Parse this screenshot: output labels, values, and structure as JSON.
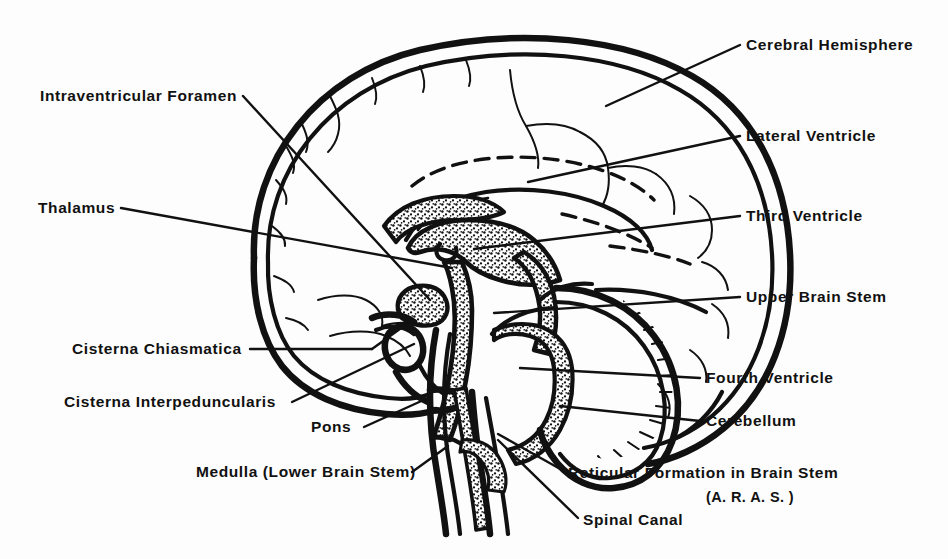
{
  "figure": {
    "type": "anatomical-line-diagram",
    "background_color": "#fdfdfd",
    "ink_color": "#111111"
  },
  "labels_left": [
    {
      "key": "intraventricular-foramen",
      "text": "Intraventricular Foramen",
      "x": 40,
      "y": 101,
      "anchor": "start"
    },
    {
      "key": "thalamus",
      "text": "Thalamus",
      "x": 38,
      "y": 213,
      "anchor": "start"
    },
    {
      "key": "cisterna-chiasmatica",
      "text": "Cisterna Chiasmatica",
      "x": 72,
      "y": 354,
      "anchor": "start"
    },
    {
      "key": "cisterna-interpeduncularis",
      "text": "Cisterna Interpeduncularis",
      "x": 64,
      "y": 407,
      "anchor": "start"
    },
    {
      "key": "pons",
      "text": "Pons",
      "x": 311,
      "y": 432,
      "anchor": "start"
    },
    {
      "key": "medulla-lower-brain-stem",
      "text": "Medulla (Lower Brain Stem)",
      "x": 196,
      "y": 477,
      "anchor": "start"
    }
  ],
  "labels_right": [
    {
      "key": "cerebral-hemisphere",
      "text": "Cerebral Hemisphere",
      "x": 746,
      "y": 50,
      "anchor": "start"
    },
    {
      "key": "lateral-ventricle",
      "text": "Lateral Ventricle",
      "x": 746,
      "y": 141,
      "anchor": "start"
    },
    {
      "key": "third-ventricle",
      "text": "Third Ventricle",
      "x": 746,
      "y": 221,
      "anchor": "start"
    },
    {
      "key": "upper-brain-stem",
      "text": "Upper Brain Stem",
      "x": 746,
      "y": 302,
      "anchor": "start"
    },
    {
      "key": "fourth-ventricle",
      "text": "Fourth Ventricle",
      "x": 706,
      "y": 383,
      "anchor": "start"
    },
    {
      "key": "cerebellum",
      "text": "Cerebellum",
      "x": 706,
      "y": 426,
      "anchor": "start"
    },
    {
      "key": "reticular-formation",
      "text": "Reticular Formation in Brain Stem",
      "x": 568,
      "y": 478,
      "anchor": "start"
    },
    {
      "key": "reticular-formation-aras",
      "text": "(A. R. A. S. )",
      "x": 706,
      "y": 502,
      "anchor": "start"
    },
    {
      "key": "spinal-canal",
      "text": "Spinal Canal",
      "x": 583,
      "y": 525,
      "anchor": "start"
    }
  ],
  "structures": [
    "skull-outline",
    "cerebral-cortex-outline",
    "cortical-sulci",
    "corpus-callosum",
    "lateral-ventricle-dashed",
    "third-ventricle",
    "thalamus",
    "intraventricular-foramen",
    "cisterna-chiasmatica",
    "cisterna-interpeduncularis",
    "upper-brain-stem",
    "pons",
    "medulla",
    "spinal-canal",
    "fourth-ventricle",
    "cerebellum",
    "reticular-formation"
  ]
}
